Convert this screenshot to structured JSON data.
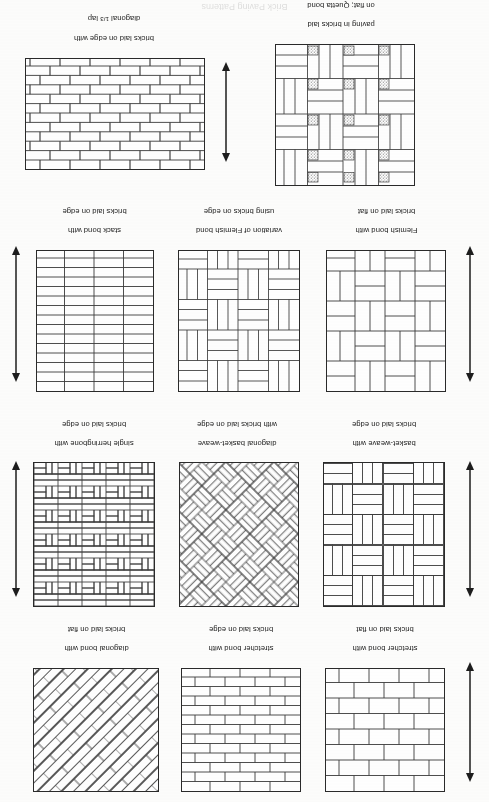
{
  "page": {
    "orientation": "upside-down scan (rotated 180 degrees)",
    "background_color": "#fdfdfc",
    "ink_color": "#2a2a2a",
    "cropped_header_text": "Brick Paving Patterns"
  },
  "figures": [
    {
      "id": "fig-diagonal-third-lap",
      "caption_line1": "bricks laid on edge with",
      "caption_line2": "diagonal 1/3 lap",
      "caption_fraction_numerator": "1",
      "caption_fraction_denominator": "3",
      "pattern": "running-bond-third-lap",
      "row": 1,
      "column": 1
    },
    {
      "id": "fig-quetta-bond",
      "caption_line1": "paving in bricks laid",
      "caption_line2": "on flat; Quetta bond",
      "caption_line3": "with concrete infill",
      "pattern": "quetta-bond-basketweave-with-infill",
      "row": 1,
      "column": 2
    },
    {
      "id": "fig-stack-bond",
      "caption_line1": "stack bond with",
      "caption_line2": "bricks laid on edge",
      "pattern": "stack-bond",
      "row": 2,
      "column": 1
    },
    {
      "id": "fig-flemish-variation",
      "caption_line1": "variation of Flemish bond",
      "caption_line2": "using bricks on edge",
      "pattern": "flemish-variation-on-edge",
      "row": 2,
      "column": 2
    },
    {
      "id": "fig-flemish-bond",
      "caption_line1": "Flemish bond with",
      "caption_line2": "bricks laid on flat",
      "pattern": "flemish-bond-on-flat",
      "row": 2,
      "column": 3
    },
    {
      "id": "fig-single-herringbone",
      "caption_line1": "single herringbone with",
      "caption_line2": "bricks laid on edge",
      "pattern": "herringbone-90",
      "row": 3,
      "column": 1
    },
    {
      "id": "fig-diagonal-basketweave",
      "caption_line1": "diagonal basket-weave",
      "caption_line2": "with bricks laid on edge",
      "pattern": "basketweave-45",
      "row": 3,
      "column": 2
    },
    {
      "id": "fig-basketweave",
      "caption_line1": "basket-weave with",
      "caption_line2": "bricks laid on edge",
      "pattern": "basketweave-90",
      "row": 3,
      "column": 3
    },
    {
      "id": "fig-diagonal-bond",
      "caption_line1": "diagonal bond with",
      "caption_line2": "bricks laid on flat",
      "pattern": "running-bond-45",
      "row": 4,
      "column": 1
    },
    {
      "id": "fig-stretcher-on-edge",
      "caption_line1": "stretcher bond with",
      "caption_line2": "bricks laid on edge",
      "pattern": "stretcher-bond-on-edge",
      "row": 4,
      "column": 2
    },
    {
      "id": "fig-stretcher-on-flat",
      "caption_line1": "stretcher bond with",
      "caption_line2": "bricks laid on flat",
      "pattern": "stretcher-bond-on-flat",
      "row": 4,
      "column": 3
    }
  ],
  "arrows": [
    {
      "id": "arrow-row1",
      "orientation": "vertical",
      "name": "direction-of-laying-arrow"
    },
    {
      "id": "arrow-row2-left",
      "orientation": "vertical",
      "name": "direction-of-laying-arrow"
    },
    {
      "id": "arrow-row2-right",
      "orientation": "vertical",
      "name": "direction-of-laying-arrow"
    },
    {
      "id": "arrow-row3-left",
      "orientation": "vertical",
      "name": "direction-of-laying-arrow"
    },
    {
      "id": "arrow-row3-right",
      "orientation": "vertical",
      "name": "direction-of-laying-arrow"
    },
    {
      "id": "arrow-row4",
      "orientation": "vertical",
      "name": "direction-of-laying-arrow"
    }
  ]
}
